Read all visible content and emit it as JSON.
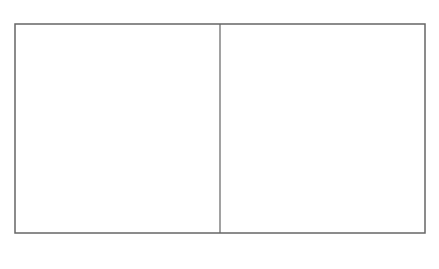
{
  "figure": {
    "type": "domain-boundary lattice diagram",
    "frame": {
      "left": 15,
      "top": 24,
      "right": 425,
      "bottom": 233
    },
    "center_x": 220,
    "line_color": "#333333",
    "frame_color": "#666666",
    "labels": {
      "top": "1\"",
      "bottom": "4\"",
      "left_path": "4'",
      "right_path": "1'"
    },
    "caption": {
      "prefix": "(K",
      "superscript": "I6",
      "suffix": ") STATE"
    },
    "dislocation_symbol": "⊥"
  }
}
